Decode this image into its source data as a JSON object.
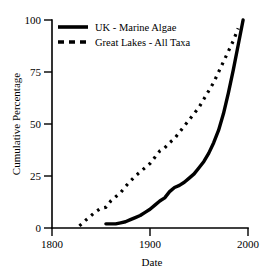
{
  "chart_data": {
    "type": "line",
    "title": "",
    "xlabel": "Date",
    "ylabel": "Cumulative Percentage",
    "xlim": [
      1800,
      2000
    ],
    "ylim": [
      0,
      100
    ],
    "xticks": [
      1800,
      1900,
      2000
    ],
    "yticks": [
      0,
      25,
      50,
      75,
      100
    ],
    "xtick_labels": [
      "1800",
      "1900",
      "2000"
    ],
    "ytick_labels": [
      "0",
      "25",
      "50",
      "75",
      "100"
    ],
    "grid": false,
    "legend_position": "top-left",
    "series": [
      {
        "name": "UK - Marine  Algae",
        "style": "solid",
        "color": "#000000",
        "x": [
          1855,
          1860,
          1865,
          1870,
          1875,
          1880,
          1885,
          1890,
          1895,
          1900,
          1905,
          1910,
          1915,
          1920,
          1925,
          1930,
          1935,
          1940,
          1945,
          1950,
          1955,
          1960,
          1965,
          1970,
          1975,
          1980,
          1985,
          1990,
          1995
        ],
        "values": [
          2,
          2,
          2,
          2.5,
          3,
          4,
          5,
          6,
          7.5,
          9,
          11,
          13,
          14.5,
          17.5,
          19.5,
          20.5,
          22,
          24,
          26,
          29,
          32,
          36,
          41,
          47,
          55,
          65,
          76,
          88,
          100
        ]
      },
      {
        "name": "Great Lakes - All Taxa",
        "style": "dotted",
        "color": "#000000",
        "x": [
          1828,
          1835,
          1840,
          1845,
          1850,
          1855,
          1860,
          1865,
          1870,
          1875,
          1880,
          1885,
          1890,
          1895,
          1900,
          1905,
          1910,
          1915,
          1920,
          1925,
          1930,
          1935,
          1940,
          1945,
          1950,
          1955,
          1960,
          1965,
          1970,
          1975,
          1980,
          1985,
          1990
        ],
        "values": [
          1,
          4,
          6,
          8,
          9.5,
          10,
          13,
          15,
          17,
          20,
          22.5,
          25,
          27,
          29,
          31,
          34,
          37,
          38.5,
          41,
          43,
          46,
          49,
          52,
          55,
          58,
          62,
          66,
          70,
          75,
          80,
          85,
          90,
          96
        ]
      }
    ]
  },
  "legend": {
    "entries": [
      {
        "label": "UK - Marine  Algae",
        "swatch": "solid-line-swatch"
      },
      {
        "label": "Great Lakes - All Taxa",
        "swatch": "dashed-line-swatch"
      }
    ]
  },
  "axes": {
    "x_title": "Date",
    "y_title": "Cumulative Percentage"
  }
}
